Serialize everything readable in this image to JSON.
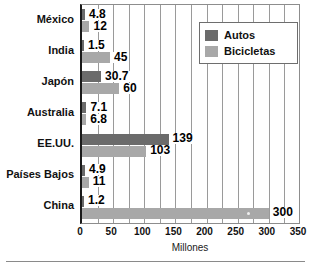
{
  "chart_data": {
    "type": "bar",
    "orientation": "horizontal",
    "title": "",
    "xlabel": "Millones",
    "ylabel": "",
    "xlim": [
      0,
      350
    ],
    "xticks": [
      0,
      50,
      100,
      150,
      200,
      250,
      300,
      350
    ],
    "xtick_labels": [
      "0",
      "50",
      "100",
      "150",
      "200",
      "250",
      "300",
      "350"
    ],
    "gridline_step": 25,
    "grid": true,
    "legend_position": "top-right",
    "categories": [
      "México",
      "India",
      "Japón",
      "Australia",
      "EE.UU.",
      "Países Bajos",
      "China"
    ],
    "series": [
      {
        "name": "Autos",
        "color": "#6b6b6b",
        "values": [
          4.8,
          1.5,
          30.7,
          7.1,
          139,
          4.9,
          1.2
        ],
        "value_labels": [
          "4.8",
          "1.5",
          "30.7",
          "7.1",
          "139",
          "4.9",
          "1.2"
        ]
      },
      {
        "name": "Bicicletas",
        "color": "#a8a8a8",
        "values": [
          12,
          45,
          60,
          6.8,
          103,
          11,
          300
        ],
        "value_labels": [
          "12",
          "45",
          "60",
          "6.8",
          "103",
          "11",
          "300"
        ]
      }
    ]
  },
  "legend": {
    "items": [
      {
        "label": "Autos",
        "color": "#6b6b6b"
      },
      {
        "label": "Bicicletas",
        "color": "#a8a8a8"
      }
    ]
  },
  "axis": {
    "x_title": "Millones"
  },
  "colors": {
    "autos": "#6b6b6b",
    "bicicletas": "#a8a8a8",
    "axis": "#1a1a1a",
    "grid": "#9a9a9a",
    "text": "#111111",
    "background": "#ffffff"
  }
}
